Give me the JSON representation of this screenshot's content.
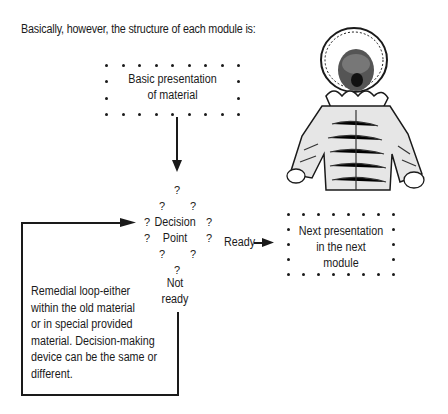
{
  "intro_text": "Basically, however, the structure of each module is:",
  "basic_box": {
    "line1": "Basic presentation",
    "line2": "of material"
  },
  "decision": {
    "question_mark": "?",
    "word1": "Decision",
    "word2": "Point"
  },
  "ready_label": "Ready",
  "not_ready": {
    "line1": "Not",
    "line2": "ready"
  },
  "next_box": {
    "line1": "Next presentation",
    "line2": "in the next",
    "line3": "module"
  },
  "remedial_note": {
    "line1": "Remedial loop-either",
    "line2": "within the old material",
    "line3": "or in special provided",
    "line4": "material. Decision-making",
    "line5": "device can be the same or",
    "line6": "different."
  },
  "illustration": {
    "subject": "crying child in bonnet and coat (engraving)"
  }
}
